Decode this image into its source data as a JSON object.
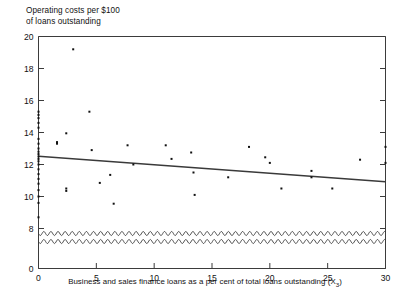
{
  "chart_data": {
    "type": "scatter",
    "title": "Operating costs per $100\nof loans outstanding",
    "ylabel": "Operating costs per $100 of loans outstanding",
    "xlabel": "Business and sales finance loans as a per cent of total loans outstanding (X",
    "xlabel_subscript": "3",
    "xlabel_suffix": ")",
    "xlim": [
      0,
      30
    ],
    "ylim": [
      0,
      20
    ],
    "y_axis_break": true,
    "y_break_range": [
      0,
      8
    ],
    "grid": false,
    "legend": null,
    "xticks": [
      0,
      5,
      10,
      15,
      20,
      25,
      30
    ],
    "xtick_labels": [
      "0",
      "5",
      "10",
      "15",
      "20",
      "25",
      "30"
    ],
    "yticks": [
      0,
      8,
      10,
      12,
      14,
      16,
      18,
      20
    ],
    "ytick_labels": [
      "0",
      "8",
      "10",
      "12",
      "14",
      "16",
      "18",
      "20"
    ],
    "y_minor_ticks": [
      8.7,
      9.2,
      9.6,
      10.0,
      10.4,
      10.8,
      11.1,
      11.4,
      11.7,
      12.0,
      12.2,
      12.35,
      12.5,
      12.65,
      12.8,
      13.0,
      13.3,
      13.6,
      14.0,
      14.3,
      14.6,
      14.9,
      15.1,
      15.3
    ],
    "marker": "square",
    "marker_color": "#111111",
    "line_color": "#3a3a3a",
    "regression_line": {
      "x": [
        0,
        30
      ],
      "y": [
        12.52,
        10.92
      ],
      "slope": -0.0533,
      "intercept": 12.52
    },
    "points": [
      {
        "x": 0.0,
        "y": 15.3
      },
      {
        "x": 0.0,
        "y": 15.1
      },
      {
        "x": 0.0,
        "y": 14.9
      },
      {
        "x": 0.0,
        "y": 14.6
      },
      {
        "x": 0.0,
        "y": 14.3
      },
      {
        "x": 0.0,
        "y": 13.6
      },
      {
        "x": 0.0,
        "y": 13.3
      },
      {
        "x": 0.0,
        "y": 13.0
      },
      {
        "x": 0.0,
        "y": 12.8
      },
      {
        "x": 0.0,
        "y": 12.65
      },
      {
        "x": 0.0,
        "y": 12.5
      },
      {
        "x": 0.0,
        "y": 12.35
      },
      {
        "x": 0.0,
        "y": 12.2
      },
      {
        "x": 0.0,
        "y": 12.0
      },
      {
        "x": 0.0,
        "y": 11.7
      },
      {
        "x": 0.0,
        "y": 11.4
      },
      {
        "x": 0.0,
        "y": 11.1
      },
      {
        "x": 0.0,
        "y": 10.8
      },
      {
        "x": 0.0,
        "y": 10.4
      },
      {
        "x": 0.0,
        "y": 10.0
      },
      {
        "x": 0.0,
        "y": 9.6
      },
      {
        "x": 0.0,
        "y": 8.7
      },
      {
        "x": 1.6,
        "y": 13.4
      },
      {
        "x": 1.6,
        "y": 13.3
      },
      {
        "x": 2.4,
        "y": 13.95
      },
      {
        "x": 2.4,
        "y": 10.5
      },
      {
        "x": 2.4,
        "y": 10.35
      },
      {
        "x": 3.0,
        "y": 19.2
      },
      {
        "x": 4.4,
        "y": 15.3
      },
      {
        "x": 4.6,
        "y": 12.9
      },
      {
        "x": 5.3,
        "y": 10.85
      },
      {
        "x": 6.2,
        "y": 11.35
      },
      {
        "x": 6.5,
        "y": 9.55
      },
      {
        "x": 7.7,
        "y": 13.2
      },
      {
        "x": 8.2,
        "y": 12.0
      },
      {
        "x": 11.0,
        "y": 13.2
      },
      {
        "x": 11.5,
        "y": 12.35
      },
      {
        "x": 13.2,
        "y": 12.75
      },
      {
        "x": 13.4,
        "y": 11.5
      },
      {
        "x": 13.5,
        "y": 10.1
      },
      {
        "x": 16.4,
        "y": 11.2
      },
      {
        "x": 18.2,
        "y": 13.1
      },
      {
        "x": 19.6,
        "y": 12.45
      },
      {
        "x": 20.0,
        "y": 12.1
      },
      {
        "x": 21.0,
        "y": 10.5
      },
      {
        "x": 23.6,
        "y": 11.6
      },
      {
        "x": 23.6,
        "y": 11.2
      },
      {
        "x": 25.4,
        "y": 10.5
      },
      {
        "x": 27.8,
        "y": 12.3
      },
      {
        "x": 30.0,
        "y": 13.1
      },
      {
        "x": 30.0,
        "y": 12.1
      }
    ]
  }
}
